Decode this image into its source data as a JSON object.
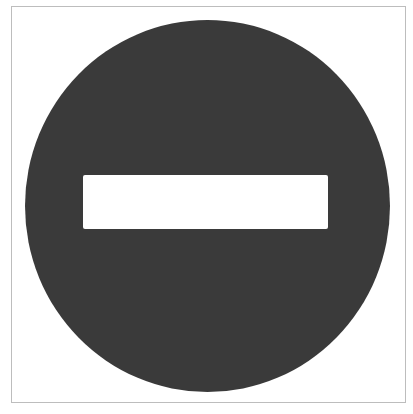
{
  "image": {
    "subject": "no-entry-sign",
    "description": "No entry traffic sign: dark circle with a white horizontal bar",
    "colors": {
      "background": "#ffffff",
      "frame_border": "#bdbdbd",
      "disc": "#3a3a3a",
      "bar": "#ffffff"
    }
  }
}
